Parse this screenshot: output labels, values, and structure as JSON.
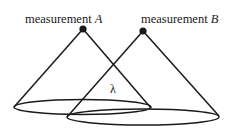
{
  "diagram": {
    "nodes": [
      {
        "id": "A",
        "label_prefix": "measurement ",
        "label_var": "A",
        "apex": [
          83,
          29
        ]
      },
      {
        "id": "B",
        "label_prefix": "measurement ",
        "label_var": "B",
        "apex": [
          143,
          31
        ]
      }
    ],
    "cones": [
      {
        "id": "cone-A",
        "ellipse": {
          "cx": 82.5,
          "cy": 107,
          "rx": 68.5,
          "ry": 7.5
        }
      },
      {
        "id": "cone-B",
        "ellipse": {
          "cx": 143,
          "cy": 117,
          "rx": 76,
          "ry": 8
        }
      }
    ],
    "overlap_label": "λ",
    "colors": {
      "stroke": "#1a1a1a",
      "background": "#ffffff"
    }
  }
}
